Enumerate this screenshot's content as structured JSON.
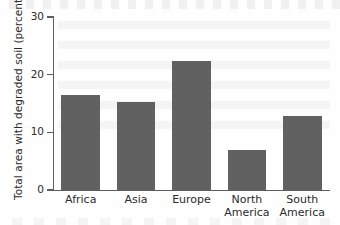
{
  "chart_data": {
    "type": "bar",
    "title": "",
    "xlabel": "",
    "ylabel": "Total area with degraded soil (percent)",
    "categories": [
      "Africa",
      "Asia",
      "Europe",
      "North America",
      "South America"
    ],
    "category_lines": [
      [
        "Africa"
      ],
      [
        "Asia"
      ],
      [
        "Europe"
      ],
      [
        "North",
        "America"
      ],
      [
        "South",
        "America"
      ]
    ],
    "values": [
      16.5,
      15.2,
      22.3,
      7.0,
      12.8
    ],
    "ylim": [
      0,
      30
    ],
    "yticks": [
      0,
      10,
      20,
      30
    ],
    "ytick_labels": [
      "0",
      "10",
      "20",
      "30"
    ],
    "grid": false,
    "legend": null,
    "bar_color": "#616161",
    "axis_color": "#5d5d5d",
    "text_color": "#2b2b2b",
    "background_color": "#fefefe"
  }
}
